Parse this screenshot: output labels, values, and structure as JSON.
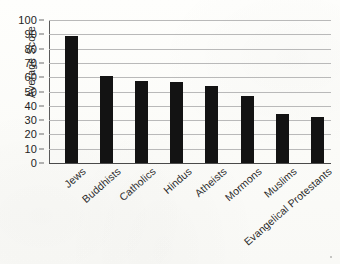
{
  "chart_data": {
    "type": "bar",
    "title": "",
    "xlabel": "",
    "ylabel": "Average Score",
    "ylim": [
      0,
      100
    ],
    "ytick_step": 10,
    "yticks": [
      100,
      90,
      80,
      70,
      60,
      50,
      40,
      30,
      20,
      10,
      0
    ],
    "grid": true,
    "legend": false,
    "bar_color": "#131313",
    "categories": [
      "Jews",
      "Buddhists",
      "Catholics",
      "Hindus",
      "Atheists",
      "Mormons",
      "Muslims",
      "Evangelical Protestants"
    ],
    "values": [
      89,
      61,
      57.5,
      56.5,
      54,
      47,
      34,
      32.5
    ]
  }
}
